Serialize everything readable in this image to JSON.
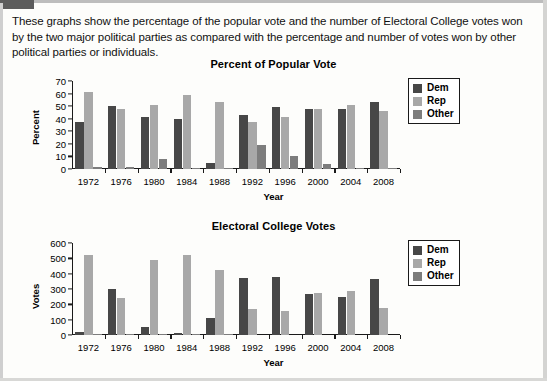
{
  "document": {
    "intro_text": "These graphs show the percentage of the popular vote and the number of Electoral College votes won by the two major political parties as compared with the percentage and number of votes won by other political parties or individuals."
  },
  "colors": {
    "dem": "#474747",
    "rep": "#a8a8a8",
    "other": "#7d7d7d",
    "axis": "#1a1a1a",
    "page_background": "#fdfdfb"
  },
  "legend": {
    "items": [
      {
        "label": "Dem",
        "color": "#474747"
      },
      {
        "label": "Rep",
        "color": "#a8a8a8"
      },
      {
        "label": "Other",
        "color": "#7d7d7d"
      }
    ]
  },
  "chart_data": [
    {
      "type": "bar",
      "title": "Percent of Popular Vote",
      "xlabel": "Year",
      "ylabel": "Percent",
      "categories": [
        "1972",
        "1976",
        "1980",
        "1984",
        "1988",
        "1992",
        "1996",
        "2000",
        "2004",
        "2008"
      ],
      "yticks": [
        0,
        10,
        20,
        30,
        40,
        50,
        60,
        70
      ],
      "ylim": [
        0,
        70
      ],
      "grid": false,
      "legend_position": "right",
      "series": [
        {
          "name": "Dem",
          "color": "#474747",
          "values": [
            37,
            50,
            41,
            40,
            5,
            43,
            49,
            48,
            48,
            53
          ]
        },
        {
          "name": "Rep",
          "color": "#a8a8a8",
          "values": [
            61,
            48,
            51,
            59,
            53,
            37,
            41,
            48,
            51,
            46
          ]
        },
        {
          "name": "Other",
          "color": "#7d7d7d",
          "values": [
            1.5,
            1.5,
            8,
            0.7,
            0.7,
            19,
            10,
            4,
            1,
            1
          ]
        }
      ]
    },
    {
      "type": "bar",
      "title": "Electoral College Votes",
      "xlabel": "Year",
      "ylabel": "Votes",
      "categories": [
        "1972",
        "1976",
        "1980",
        "1984",
        "1988",
        "1992",
        "1996",
        "2000",
        "2004",
        "2008"
      ],
      "yticks": [
        0,
        100,
        200,
        300,
        400,
        500,
        600
      ],
      "ylim": [
        0,
        600
      ],
      "grid": false,
      "legend_position": "right",
      "series": [
        {
          "name": "Dem",
          "color": "#474747",
          "values": [
            17,
            297,
            49,
            13,
            111,
            370,
            379,
            266,
            251,
            365
          ]
        },
        {
          "name": "Rep",
          "color": "#a8a8a8",
          "values": [
            520,
            240,
            489,
            525,
            426,
            168,
            159,
            271,
            286,
            173
          ]
        },
        {
          "name": "Other",
          "color": "#7d7d7d",
          "values": [
            1,
            1,
            1,
            1,
            1,
            0,
            0,
            0,
            0,
            0
          ]
        }
      ]
    }
  ]
}
